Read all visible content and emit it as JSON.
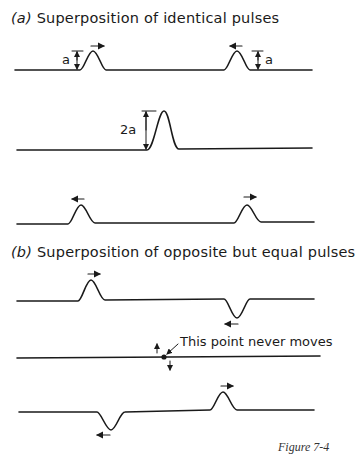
{
  "part_a": {
    "tag": "(a)",
    "title": "Superposition of identical pulses",
    "amplitude_label": "a",
    "sum_label": "2a"
  },
  "part_b": {
    "tag": "(b)",
    "title": "Superposition of opposite but equal pulses",
    "annotation": "This point never moves"
  },
  "caption": "Figure 7-4"
}
